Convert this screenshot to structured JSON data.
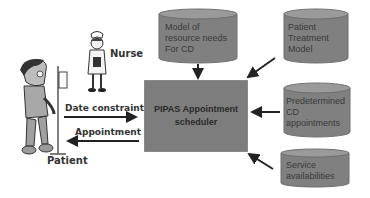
{
  "diagram": {
    "actors": {
      "nurse": {
        "label": "Nurse",
        "icon": "nurse-figure-icon"
      },
      "patient": {
        "label": "Patient",
        "icon": "patient-with-iv-icon"
      }
    },
    "scheduler": {
      "line1": "PIPAS Appointment",
      "line2": "scheduler"
    },
    "flows": {
      "to_scheduler": "Date constraints",
      "from_scheduler": "Appointment"
    },
    "data_stores": [
      {
        "lines": [
          "Model of",
          "resource needs",
          "For CD"
        ]
      },
      {
        "lines": [
          "Patient",
          "Treatment",
          "Model"
        ]
      },
      {
        "lines": [
          "Predetermined",
          "CD",
          "appointments"
        ]
      },
      {
        "lines": [
          "Service",
          "availabilities"
        ]
      }
    ],
    "colors": {
      "box_fill": "#7d7d7d",
      "cylinder_fill": "#808080",
      "cylinder_top": "#9a9a9a",
      "arrow": "#222222"
    }
  }
}
